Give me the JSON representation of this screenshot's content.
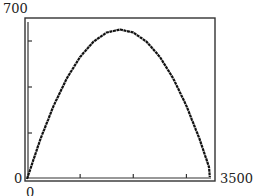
{
  "chart_data": {
    "type": "line",
    "title": "",
    "xlabel": "",
    "ylabel": "",
    "xlim": [
      0,
      3500
    ],
    "ylim": [
      0,
      700
    ],
    "x_ticks": [
      1000,
      2000,
      3000
    ],
    "y_ticks": [
      200,
      400,
      600
    ],
    "x_tick_labels": {
      "min": "0",
      "max": "3500"
    },
    "y_tick_labels": {
      "min": "0",
      "max": "700"
    },
    "grid": false,
    "legend": null,
    "series": [
      {
        "name": "curve",
        "x": [
          0,
          250,
          500,
          750,
          1000,
          1250,
          1500,
          1750,
          2000,
          2250,
          2500,
          2750,
          3000,
          3250,
          3500
        ],
        "values": [
          0,
          172,
          318,
          438,
          531,
          597,
          637,
          650,
          637,
          597,
          531,
          438,
          318,
          172,
          0
        ]
      }
    ],
    "style": {
      "line_color": "#111111",
      "frame_color": "#333333"
    }
  }
}
